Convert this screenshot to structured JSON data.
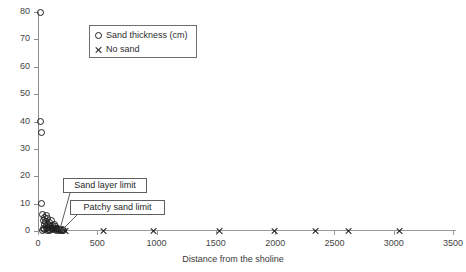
{
  "chart_data": {
    "type": "scatter",
    "title": "",
    "xlabel": "Distance from the sholine",
    "ylabel": "",
    "xlim": [
      0,
      3500
    ],
    "ylim": [
      0,
      80
    ],
    "grid": false,
    "legend_position": "top-left-inset",
    "x_ticks": [
      "0",
      "500",
      "1000",
      "1500",
      "2000",
      "2500",
      "3000",
      "3500"
    ],
    "x_tick_values": [
      0,
      500,
      1000,
      1500,
      2000,
      2500,
      3000,
      3500
    ],
    "y_ticks": [
      "0",
      "10",
      "20",
      "30",
      "40",
      "50",
      "60",
      "70",
      "80"
    ],
    "y_tick_values": [
      0,
      10,
      20,
      30,
      40,
      50,
      60,
      70,
      80
    ],
    "series": [
      {
        "name": "Sand thickness (cm)",
        "marker": "circle",
        "color": "#1d1d1d",
        "points": [
          [
            20,
            80
          ],
          [
            25,
            40
          ],
          [
            30,
            36
          ],
          [
            28,
            10
          ],
          [
            40,
            6
          ],
          [
            55,
            5
          ],
          [
            70,
            5.5
          ],
          [
            48,
            4
          ],
          [
            62,
            3.5
          ],
          [
            80,
            4.5
          ],
          [
            95,
            3
          ],
          [
            110,
            4
          ],
          [
            58,
            2.5
          ],
          [
            75,
            2
          ],
          [
            90,
            2.5
          ],
          [
            105,
            1.5
          ],
          [
            120,
            2
          ],
          [
            135,
            2.5
          ],
          [
            150,
            1.5
          ],
          [
            165,
            1
          ],
          [
            45,
            1
          ],
          [
            68,
            0.8
          ],
          [
            85,
            1.2
          ],
          [
            100,
            0.6
          ],
          [
            115,
            1
          ],
          [
            130,
            0.8
          ],
          [
            145,
            0.5
          ],
          [
            160,
            1
          ],
          [
            175,
            0.6
          ],
          [
            190,
            0.4
          ],
          [
            205,
            0.5
          ],
          [
            35,
            0.3
          ],
          [
            52,
            0.4
          ],
          [
            78,
            0.3
          ],
          [
            98,
            0.3
          ],
          [
            125,
            0.4
          ],
          [
            155,
            0.3
          ],
          [
            180,
            0.3
          ],
          [
            200,
            0.2
          ],
          [
            215,
            0.2
          ]
        ]
      },
      {
        "name": "No sand",
        "marker": "cross",
        "color": "#1d1d1d",
        "points": [
          [
            230,
            0
          ],
          [
            550,
            0
          ],
          [
            975,
            0
          ],
          [
            1530,
            0
          ],
          [
            2000,
            0
          ],
          [
            2340,
            0
          ],
          [
            2620,
            0
          ],
          [
            3050,
            0
          ]
        ]
      }
    ],
    "annotations": [
      {
        "id": "sand-layer-limit",
        "label": "Sand layer limit",
        "target": [
          150,
          1.5
        ]
      },
      {
        "id": "patchy-sand-limit",
        "label": "Patchy sand limit",
        "target": [
          225,
          0
        ]
      }
    ]
  },
  "legend": {
    "items": [
      {
        "marker": "circle",
        "label": "Sand thickness (cm)"
      },
      {
        "marker": "cross",
        "label": "No sand"
      }
    ]
  }
}
